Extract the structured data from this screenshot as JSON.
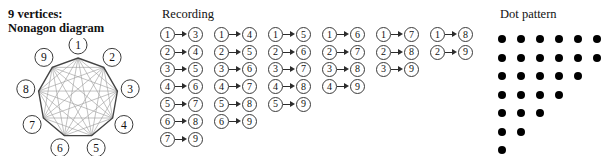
{
  "figure": {
    "background": "#ffffff",
    "ink": "#111111"
  },
  "nonagon_panel": {
    "caption_line1": "9 vertices:",
    "caption_line2": "Nonagon diagram",
    "vertex_count": 9,
    "vertex_labels": [
      "1",
      "2",
      "3",
      "4",
      "5",
      "6",
      "7",
      "8",
      "9"
    ],
    "outline_color": "#444444",
    "diagonal_color": "#999999",
    "vertex_circle_color": "#3a3a3a"
  },
  "recording_panel": {
    "title": "Recording",
    "arrow_glyph": "arrow-right-icon",
    "columns": [
      {
        "gap": 2,
        "pairs": [
          {
            "from": "1",
            "to": "3"
          },
          {
            "from": "2",
            "to": "4"
          },
          {
            "from": "3",
            "to": "5"
          },
          {
            "from": "4",
            "to": "6"
          },
          {
            "from": "5",
            "to": "7"
          },
          {
            "from": "6",
            "to": "8"
          },
          {
            "from": "7",
            "to": "9"
          }
        ]
      },
      {
        "gap": 3,
        "pairs": [
          {
            "from": "1",
            "to": "4"
          },
          {
            "from": "2",
            "to": "5"
          },
          {
            "from": "3",
            "to": "6"
          },
          {
            "from": "4",
            "to": "7"
          },
          {
            "from": "5",
            "to": "8"
          },
          {
            "from": "6",
            "to": "9"
          }
        ]
      },
      {
        "gap": 4,
        "pairs": [
          {
            "from": "1",
            "to": "5"
          },
          {
            "from": "2",
            "to": "6"
          },
          {
            "from": "3",
            "to": "7"
          },
          {
            "from": "4",
            "to": "8"
          },
          {
            "from": "5",
            "to": "9"
          }
        ]
      },
      {
        "gap": 5,
        "pairs": [
          {
            "from": "1",
            "to": "6"
          },
          {
            "from": "2",
            "to": "7"
          },
          {
            "from": "3",
            "to": "8"
          },
          {
            "from": "4",
            "to": "9"
          }
        ]
      },
      {
        "gap": 6,
        "pairs": [
          {
            "from": "1",
            "to": "7"
          },
          {
            "from": "2",
            "to": "8"
          },
          {
            "from": "3",
            "to": "9"
          }
        ]
      },
      {
        "gap": 7,
        "pairs": [
          {
            "from": "1",
            "to": "8"
          },
          {
            "from": "2",
            "to": "9"
          }
        ]
      }
    ]
  },
  "dot_panel": {
    "title": "Dot pattern",
    "dot_color": "#000000",
    "row_counts": [
      6,
      6,
      5,
      4,
      3,
      2,
      1
    ],
    "total_dots": 27
  }
}
